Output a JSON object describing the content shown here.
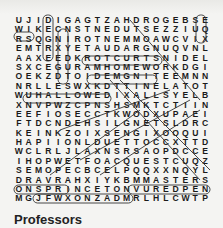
{
  "puzzle": {
    "rows": [
      "UJIDIGAGTZAHDROGEBSE",
      "WIKECNSTNEDUTSEZZIUQ",
      "RSQGNIROTNEMMOAWCVIX",
      "EMTRXYETAUDARGNUQVNL",
      "AAXEEDKROTCURTSNIDEL",
      "SXCEGURAMHOMEWORKDGI",
      "OEKZDTOIDEMGNITEEMNN",
      "NRLLESWXKDTTINELATOT",
      "WUHALLOWEDIXALLSYELB",
      "XNVPWZCPNSHSMKTCTIIN",
      "EEFIOSECCTKWODXUPAEI",
      "FTDCNDEHSILGNETSLDRC",
      "KEINKZOIXSENGIXOOQUI",
      "HAPIIONLDUETTOCCXTTD",
      "WCLRLJLAXNSRSAOPDCCE",
      "IHOPWETFOACQUESTCUQZ",
      "SEMOPECBCELPQQXXNQYL",
      "DRAVRAHXIYKBMMASTERS",
      "ONSPRINCETONVUREDPEN",
      "MGJFWXONZADMRLHLCWTP"
    ]
  },
  "word_list": {
    "title": "Professors"
  }
}
